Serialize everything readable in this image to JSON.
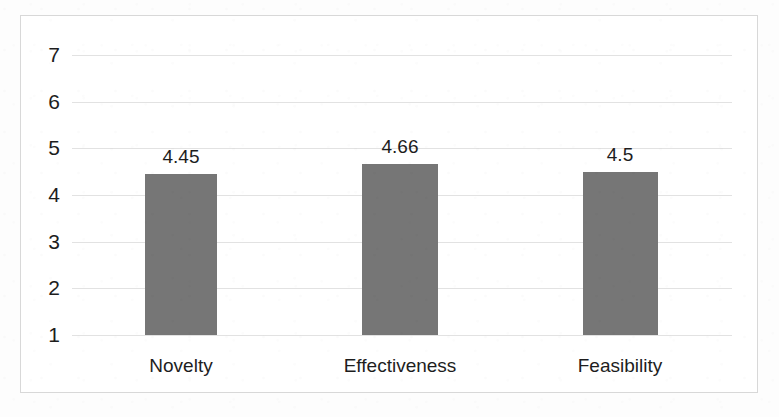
{
  "chart_data": {
    "type": "bar",
    "title": "",
    "subtitle": "",
    "xlabel": "",
    "ylabel": "",
    "categories": [
      "Novelty",
      "Effectiveness",
      "Feasibility"
    ],
    "values": [
      4.45,
      4.66,
      4.5
    ],
    "value_labels": [
      "4.45",
      "4.66",
      "4.5"
    ],
    "series": [
      {
        "name": "",
        "values": [
          4.45,
          4.66,
          4.5
        ]
      }
    ],
    "ylim": [
      1,
      7
    ],
    "y_ticks": [
      7,
      6,
      5,
      4,
      3,
      2,
      1
    ],
    "y_tick_labels": [
      "7",
      "6",
      "5",
      "4",
      "3",
      "2",
      "1"
    ],
    "grid": true,
    "grid_axis": "y",
    "legend": false,
    "legend_position": "none",
    "bar_color": "#767676",
    "gridline_color": "#e2e2e2",
    "frame_color": "#d8d8d8",
    "text_color": "#1d1d1d",
    "background_color": "#ffffff",
    "data_labels_shown": true
  }
}
